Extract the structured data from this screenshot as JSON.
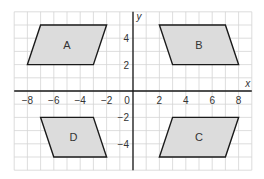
{
  "diagram": {
    "type": "coordinate-grid",
    "axes": {
      "x_label": "x",
      "y_label": "y",
      "x_range": [
        -9,
        9
      ],
      "y_range": [
        -6,
        6
      ],
      "x_ticks": [
        -8,
        -6,
        -4,
        -2,
        0,
        2,
        4,
        6,
        8
      ],
      "x_tick_labels": [
        "−8",
        "−6",
        "−4",
        "−2",
        "0",
        "2",
        "4",
        "6",
        "8"
      ],
      "y_ticks": [
        4,
        2,
        -2,
        -4
      ],
      "y_tick_labels": [
        "4",
        "2",
        "−2",
        "−4"
      ]
    },
    "shapes": [
      {
        "label": "A",
        "vertices": [
          [
            -7,
            5
          ],
          [
            -2,
            5
          ],
          [
            -3,
            2
          ],
          [
            -8,
            2
          ]
        ]
      },
      {
        "label": "B",
        "vertices": [
          [
            2,
            5
          ],
          [
            7,
            5
          ],
          [
            8,
            2
          ],
          [
            3,
            2
          ]
        ]
      },
      {
        "label": "C",
        "vertices": [
          [
            3,
            -2
          ],
          [
            8,
            -2
          ],
          [
            7,
            -5
          ],
          [
            2,
            -5
          ]
        ]
      },
      {
        "label": "D",
        "vertices": [
          [
            -7,
            -2
          ],
          [
            -3,
            -2
          ],
          [
            -2,
            -5
          ],
          [
            -6,
            -5
          ]
        ]
      }
    ],
    "colors": {
      "shape_fill": "#dcdcdc",
      "shape_stroke": "#1a1a1a",
      "grid": "#d4d4d4",
      "axis": "#1a1a1a"
    }
  }
}
